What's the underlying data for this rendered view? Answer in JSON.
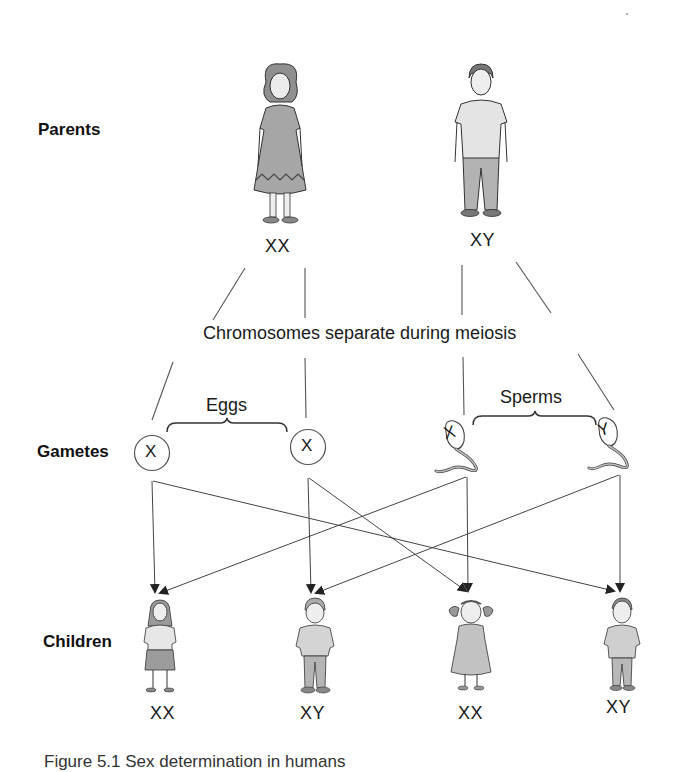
{
  "diagram": {
    "rows": {
      "parents": "Parents",
      "gametes": "Gametes",
      "children": "Children"
    },
    "parents": [
      {
        "role": "mother",
        "genotype": "XX",
        "icon": "woman-figure"
      },
      {
        "role": "father",
        "genotype": "XY",
        "icon": "man-figure"
      }
    ],
    "meiosis_label": "Chromosomes separate during meiosis",
    "gamete_groups": {
      "eggs_label": "Eggs",
      "sperms_label": "Sperms"
    },
    "gametes": [
      {
        "type": "egg",
        "chromosome": "X"
      },
      {
        "type": "egg",
        "chromosome": "X"
      },
      {
        "type": "sperm",
        "chromosome": "X"
      },
      {
        "type": "sperm",
        "chromosome": "Y"
      }
    ],
    "children": [
      {
        "genotype": "XX",
        "icon": "girl-figure"
      },
      {
        "genotype": "XY",
        "icon": "boy-figure"
      },
      {
        "genotype": "XX",
        "icon": "girl-figure"
      },
      {
        "genotype": "XY",
        "icon": "boy-figure"
      }
    ],
    "caption": "Figure 5.1 Sex determination in humans"
  },
  "colors": {
    "line": "#555555",
    "arrow": "#333333",
    "figure_fill": "#c8c8c8",
    "dress_fill": "#a9a9a9",
    "text": "#1a1a1a"
  }
}
